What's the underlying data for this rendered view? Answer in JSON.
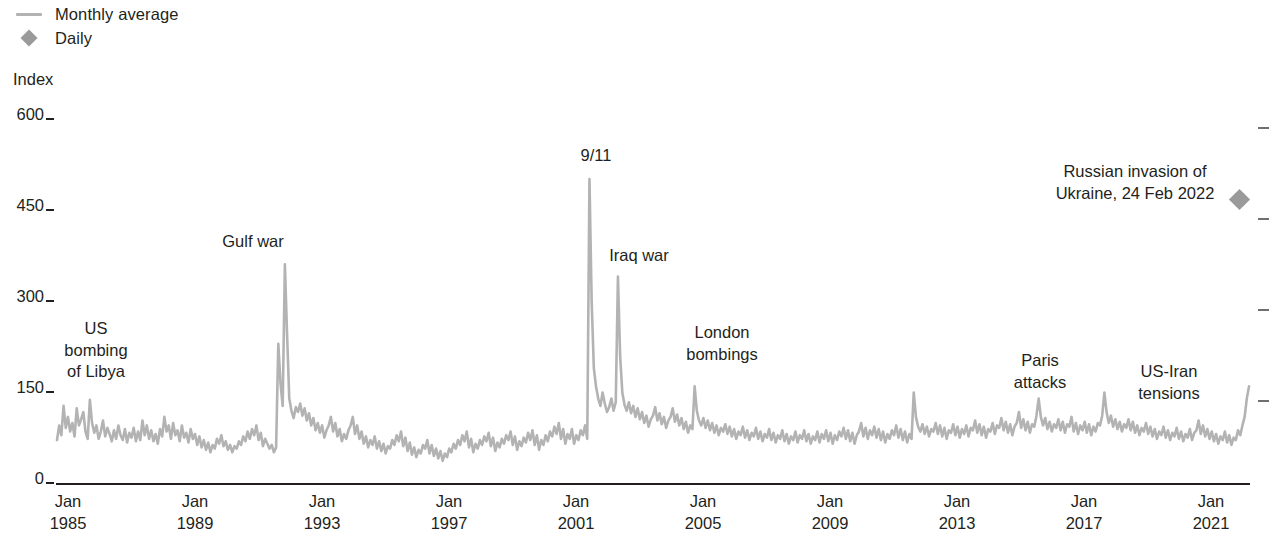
{
  "legend": {
    "items": [
      {
        "label": "Monthly average",
        "marker": "line-swatch",
        "color": "#b3b3b3"
      },
      {
        "label": "Daily",
        "marker": "diamond-marker",
        "color": "#9a9a9a"
      }
    ]
  },
  "chart_data": {
    "type": "line",
    "title": "",
    "subtitle": "",
    "xlabel": "",
    "ylabel": "Index",
    "ylim": [
      0,
      600
    ],
    "yticks": [
      0,
      150,
      300,
      450,
      600
    ],
    "ytick_labels": [
      "0",
      "150",
      "300",
      "450",
      "600"
    ],
    "xlim": [
      "1985-01",
      "2022-06"
    ],
    "xticks": [
      "Jan 1985",
      "Jan 1989",
      "Jan 1993",
      "Jan 1997",
      "Jan 2001",
      "Jan 2005",
      "Jan 2009",
      "Jan 2013",
      "Jan 2017",
      "Jan 2021"
    ],
    "xtick_labels": [
      {
        "month": "Jan",
        "year": "1985"
      },
      {
        "month": "Jan",
        "year": "1989"
      },
      {
        "month": "Jan",
        "year": "1993"
      },
      {
        "month": "Jan",
        "year": "1997"
      },
      {
        "month": "Jan",
        "year": "2001"
      },
      {
        "month": "Jan",
        "year": "2005"
      },
      {
        "month": "Jan",
        "year": "2009"
      },
      {
        "month": "Jan",
        "year": "2013"
      },
      {
        "month": "Jan",
        "year": "2017"
      },
      {
        "month": "Jan",
        "year": "2021"
      }
    ],
    "grid": false,
    "legend_position": "top-left",
    "line_color": "#b3b3b3",
    "series": [
      {
        "name": "Monthly average",
        "type": "line",
        "color": "#b3b3b3",
        "x_start": "1985-01",
        "x_step_months": 1,
        "values": [
          72,
          96,
          80,
          128,
          92,
          110,
          86,
          100,
          78,
          124,
          96,
          106,
          118,
          86,
          74,
          138,
          100,
          84,
          96,
          74,
          86,
          104,
          78,
          92,
          82,
          70,
          88,
          74,
          96,
          80,
          72,
          90,
          68,
          84,
          76,
          92,
          70,
          86,
          72,
          104,
          80,
          96,
          74,
          88,
          70,
          82,
          66,
          90,
          78,
          110,
          86,
          96,
          74,
          100,
          80,
          88,
          70,
          96,
          76,
          84,
          68,
          90,
          74,
          82,
          64,
          78,
          60,
          72,
          56,
          68,
          52,
          64,
          58,
          74,
          66,
          80,
          62,
          70,
          56,
          64,
          52,
          62,
          58,
          70,
          64,
          78,
          70,
          86,
          74,
          90,
          80,
          96,
          72,
          84,
          62,
          74,
          66,
          58,
          64,
          52,
          60,
          230,
          165,
          128,
          360,
          246,
          140,
          120,
          108,
          126,
          118,
          132,
          112,
          124,
          104,
          116,
          96,
          108,
          88,
          100,
          84,
          96,
          76,
          88,
          96,
          110,
          86,
          100,
          78,
          90,
          70,
          82,
          74,
          88,
          96,
          110,
          82,
          96,
          74,
          86,
          66,
          78,
          60,
          72,
          64,
          78,
          58,
          70,
          54,
          66,
          50,
          62,
          58,
          72,
          64,
          80,
          70,
          86,
          62,
          76,
          54,
          68,
          48,
          60,
          44,
          56,
          50,
          64,
          58,
          72,
          50,
          64,
          46,
          58,
          42,
          54,
          38,
          50,
          44,
          58,
          52,
          66,
          58,
          72,
          64,
          80,
          70,
          86,
          60,
          74,
          52,
          66,
          58,
          72,
          64,
          78,
          70,
          84,
          62,
          76,
          54,
          68,
          60,
          74,
          66,
          80,
          72,
          86,
          64,
          78,
          56,
          70,
          62,
          76,
          68,
          84,
          72,
          88,
          64,
          80,
          56,
          72,
          64,
          80,
          70,
          86,
          78,
          94,
          82,
          100,
          74,
          90,
          66,
          82,
          74,
          90,
          66,
          80,
          72,
          88,
          80,
          96,
          74,
          500,
          300,
          190,
          160,
          140,
          128,
          150,
          132,
          118,
          126,
          140,
          120,
          134,
          340,
          210,
          150,
          130,
          120,
          134,
          116,
          128,
          110,
          124,
          106,
          118,
          100,
          112,
          94,
          106,
          112,
          126,
          104,
          116,
          98,
          110,
          92,
          104,
          110,
          124,
          102,
          114,
          96,
          108,
          90,
          102,
          84,
          96,
          90,
          160,
          120,
          104,
          96,
          108,
          92,
          104,
          88,
          100,
          84,
          96,
          80,
          92,
          86,
          98,
          82,
          94,
          78,
          90,
          74,
          86,
          80,
          94,
          76,
          88,
          72,
          84,
          78,
          92,
          74,
          86,
          70,
          82,
          76,
          90,
          72,
          84,
          68,
          80,
          74,
          88,
          70,
          82,
          66,
          78,
          72,
          86,
          68,
          80,
          74,
          88,
          70,
          82,
          66,
          78,
          72,
          86,
          68,
          82,
          74,
          88,
          70,
          84,
          66,
          80,
          72,
          86,
          78,
          92,
          74,
          88,
          70,
          84,
          66,
          80,
          86,
          100,
          78,
          92,
          74,
          88,
          80,
          94,
          76,
          90,
          72,
          86,
          68,
          82,
          74,
          88,
          80,
          96,
          76,
          90,
          72,
          86,
          68,
          82,
          74,
          150,
          110,
          94,
          86,
          98,
          82,
          94,
          78,
          90,
          86,
          100,
          82,
          96,
          78,
          92,
          74,
          88,
          84,
          98,
          80,
          94,
          76,
          90,
          82,
          96,
          78,
          92,
          88,
          104,
          84,
          98,
          80,
          94,
          76,
          90,
          86,
          100,
          82,
          96,
          92,
          108,
          88,
          102,
          84,
          98,
          80,
          94,
          100,
          118,
          92,
          106,
          88,
          102,
          84,
          98,
          94,
          112,
          140,
          110,
          96,
          108,
          90,
          102,
          86,
          98,
          92,
          106,
          88,
          102,
          84,
          98,
          94,
          110,
          86,
          100,
          82,
          96,
          88,
          102,
          84,
          98,
          80,
          94,
          86,
          100,
          96,
          112,
          150,
          118,
          100,
          112,
          94,
          106,
          90,
          102,
          86,
          98,
          92,
          106,
          88,
          102,
          84,
          96,
          80,
          92,
          86,
          100,
          82,
          94,
          78,
          90,
          74,
          86,
          80,
          94,
          76,
          88,
          72,
          84,
          78,
          92,
          74,
          86,
          70,
          82,
          76,
          90,
          72,
          84,
          88,
          104,
          82,
          96,
          78,
          90,
          74,
          86,
          70,
          82,
          66,
          78,
          72,
          86,
          68,
          80,
          64,
          76,
          72,
          88,
          80,
          96,
          110,
          140,
          160
        ],
        "annotation_peaks": [
          {
            "label": "US bombing of Libya",
            "approx_value": 128,
            "approx_date": "1986-04"
          },
          {
            "label": "Gulf war",
            "approx_value": 360,
            "approx_date": "1991-01"
          },
          {
            "label": "9/11",
            "approx_value": 500,
            "approx_date": "2001-09"
          },
          {
            "label": "Iraq war",
            "approx_value": 340,
            "approx_date": "2003-03"
          },
          {
            "label": "London bombings",
            "approx_value": 160,
            "approx_date": "2005-07"
          },
          {
            "label": "Paris attacks",
            "approx_value": 150,
            "approx_date": "2015-11"
          },
          {
            "label": "US-Iran tensions",
            "approx_value": 150,
            "approx_date": "2020-01"
          }
        ]
      },
      {
        "name": "Daily",
        "type": "scatter",
        "color": "#9a9a9a",
        "marker": "diamond",
        "points": [
          {
            "label": "Russian invasion of Ukraine, 24 Feb 2022",
            "date": "2022-02-24",
            "value": 460
          }
        ]
      }
    ],
    "annotations": [
      {
        "id": "us-bombing-of-libya",
        "lines": [
          "US",
          "bombing",
          "of Libya"
        ],
        "x": 96,
        "y": 318
      },
      {
        "id": "gulf-war",
        "lines": [
          "Gulf war"
        ],
        "x": 253,
        "y": 231
      },
      {
        "id": "nine-eleven",
        "lines": [
          "9/11"
        ],
        "x": 596,
        "y": 145
      },
      {
        "id": "iraq-war",
        "lines": [
          "Iraq war"
        ],
        "x": 639,
        "y": 245
      },
      {
        "id": "london-bombings",
        "lines": [
          "London",
          "bombings"
        ],
        "x": 722,
        "y": 322
      },
      {
        "id": "paris-attacks",
        "lines": [
          "Paris",
          "attacks"
        ],
        "x": 1040,
        "y": 350
      },
      {
        "id": "us-iran-tensions",
        "lines": [
          "US-Iran",
          "tensions"
        ],
        "x": 1169,
        "y": 361
      },
      {
        "id": "russian-invasion",
        "lines": [
          "Russian invasion of",
          "Ukraine, 24 Feb 2022"
        ],
        "x": 1150,
        "y": 161
      }
    ]
  }
}
